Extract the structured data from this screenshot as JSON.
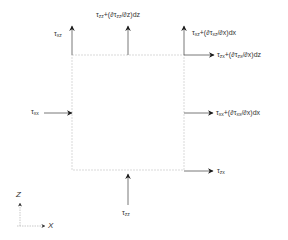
{
  "diagram": {
    "type": "stress element free-body diagram",
    "labels": {
      "tau_xz": "τxz",
      "tau_zz_top": "τzz+(∂τzz/∂z)dz",
      "tau_xz_right": "τxz+(∂τxz/∂x)dx",
      "tau_zx_right_top": "τzx+(∂τzx/∂x)dz",
      "tau_xx_left": "τxx",
      "tau_xx_right": "τxx+(∂τxx/∂x)dx",
      "tau_zx_bottom": "τzx",
      "tau_zz_bottom": "τzz"
    },
    "axes": {
      "z": "Z",
      "x": "X"
    },
    "colors": {
      "arrow": "#1a1a1a",
      "element_edge": "#c8c8c8",
      "axis": "#bbbbbb"
    }
  }
}
